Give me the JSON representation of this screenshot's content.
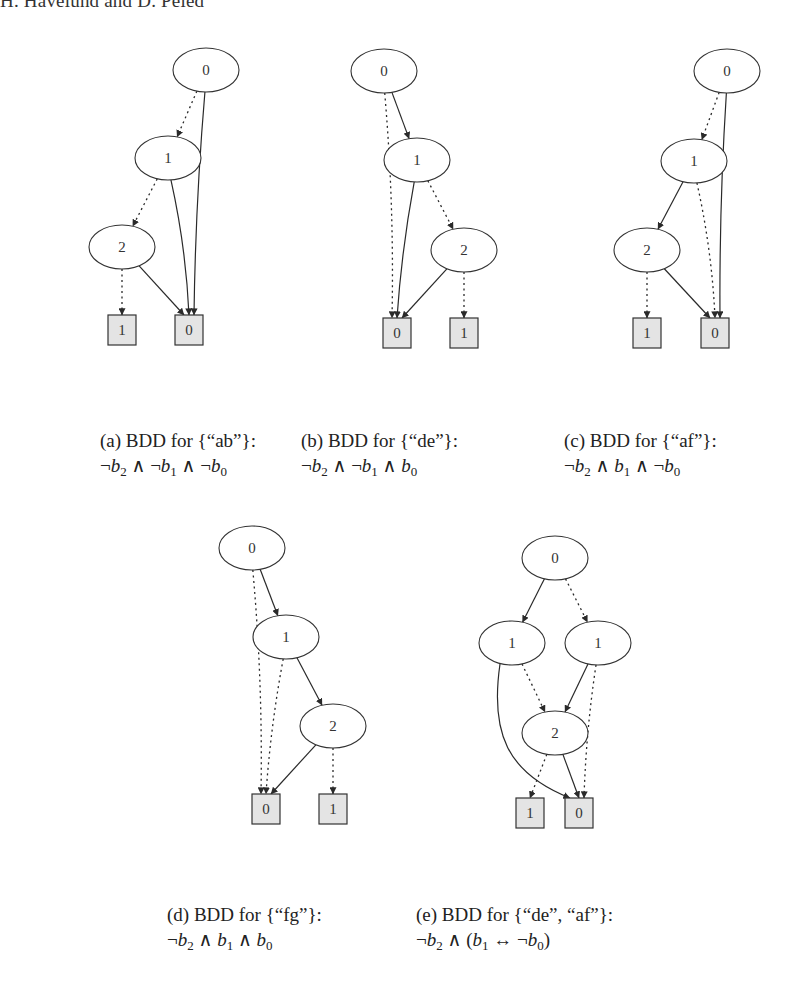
{
  "running_head": "H. Havelund and D. Peled",
  "styles": {
    "node_stroke": "#333333",
    "terminal_fill": "#e4e4e4",
    "text_color": "#222222"
  },
  "legend_semantics": {
    "dotted_edge": "low (false) branch",
    "solid_edge": "high (true) branch"
  },
  "figures": [
    {
      "id": "a",
      "caption_title": "(a) BDD for {“ab”}:",
      "formula_text": "¬b2 ∧ ¬b1 ∧ ¬b0",
      "nodes": [
        {
          "id": "n0",
          "label": "0",
          "type": "var",
          "cx": 206,
          "cy": 70
        },
        {
          "id": "n1",
          "label": "1",
          "type": "var",
          "cx": 168,
          "cy": 158
        },
        {
          "id": "n2",
          "label": "2",
          "type": "var",
          "cx": 122,
          "cy": 247
        },
        {
          "id": "t1",
          "label": "1",
          "type": "terminal",
          "cx": 122,
          "cy": 330
        },
        {
          "id": "t0",
          "label": "0",
          "type": "terminal",
          "cx": 189,
          "cy": 330
        }
      ],
      "edges": [
        {
          "from": "n0",
          "to": "n1",
          "style": "dotted"
        },
        {
          "from": "n0",
          "to": "t0",
          "style": "solid"
        },
        {
          "from": "n1",
          "to": "n2",
          "style": "dotted"
        },
        {
          "from": "n1",
          "to": "t0",
          "style": "solid"
        },
        {
          "from": "n2",
          "to": "t1",
          "style": "dotted"
        },
        {
          "from": "n2",
          "to": "t0",
          "style": "solid"
        }
      ]
    },
    {
      "id": "b",
      "caption_title": "(b) BDD for {“de”}:",
      "formula_text": "¬b2 ∧ ¬b1 ∧ b0",
      "nodes": [
        {
          "id": "n0",
          "label": "0",
          "type": "var",
          "cx": 384,
          "cy": 71
        },
        {
          "id": "n1",
          "label": "1",
          "type": "var",
          "cx": 417,
          "cy": 160
        },
        {
          "id": "n2",
          "label": "2",
          "type": "var",
          "cx": 464,
          "cy": 250
        },
        {
          "id": "t0",
          "label": "0",
          "type": "terminal",
          "cx": 397,
          "cy": 333
        },
        {
          "id": "t1",
          "label": "1",
          "type": "terminal",
          "cx": 464,
          "cy": 333
        }
      ],
      "edges": [
        {
          "from": "n0",
          "to": "t0",
          "style": "dotted"
        },
        {
          "from": "n0",
          "to": "n1",
          "style": "solid"
        },
        {
          "from": "n1",
          "to": "n2",
          "style": "dotted"
        },
        {
          "from": "n1",
          "to": "t0",
          "style": "solid"
        },
        {
          "from": "n2",
          "to": "t1",
          "style": "dotted"
        },
        {
          "from": "n2",
          "to": "t0",
          "style": "solid"
        }
      ]
    },
    {
      "id": "c",
      "caption_title": "(c) BDD for {“af”}:",
      "formula_text": "¬b2 ∧ b1 ∧ ¬b0",
      "nodes": [
        {
          "id": "n0",
          "label": "0",
          "type": "var",
          "cx": 727,
          "cy": 71
        },
        {
          "id": "n1",
          "label": "1",
          "type": "var",
          "cx": 694,
          "cy": 161
        },
        {
          "id": "n2",
          "label": "2",
          "type": "var",
          "cx": 647,
          "cy": 250
        },
        {
          "id": "t1",
          "label": "1",
          "type": "terminal",
          "cx": 647,
          "cy": 333
        },
        {
          "id": "t0",
          "label": "0",
          "type": "terminal",
          "cx": 715,
          "cy": 333
        }
      ],
      "edges": [
        {
          "from": "n0",
          "to": "n1",
          "style": "dotted"
        },
        {
          "from": "n0",
          "to": "t0",
          "style": "solid"
        },
        {
          "from": "n1",
          "to": "n2",
          "style": "solid"
        },
        {
          "from": "n1",
          "to": "t0",
          "style": "dotted"
        },
        {
          "from": "n2",
          "to": "t1",
          "style": "dotted"
        },
        {
          "from": "n2",
          "to": "t0",
          "style": "solid"
        }
      ]
    },
    {
      "id": "d",
      "caption_title": "(d) BDD for {“fg”}:",
      "formula_text": "¬b2 ∧ b1 ∧ b0",
      "nodes": [
        {
          "id": "n0",
          "label": "0",
          "type": "var",
          "cx": 252,
          "cy": 548
        },
        {
          "id": "n1",
          "label": "1",
          "type": "var",
          "cx": 286,
          "cy": 637
        },
        {
          "id": "n2",
          "label": "2",
          "type": "var",
          "cx": 333,
          "cy": 726
        },
        {
          "id": "t0",
          "label": "0",
          "type": "terminal",
          "cx": 266,
          "cy": 809
        },
        {
          "id": "t1",
          "label": "1",
          "type": "terminal",
          "cx": 333,
          "cy": 809
        }
      ],
      "edges": [
        {
          "from": "n0",
          "to": "t0",
          "style": "dotted"
        },
        {
          "from": "n0",
          "to": "n1",
          "style": "solid"
        },
        {
          "from": "n1",
          "to": "t0",
          "style": "dotted"
        },
        {
          "from": "n1",
          "to": "n2",
          "style": "solid"
        },
        {
          "from": "n2",
          "to": "t1",
          "style": "dotted"
        },
        {
          "from": "n2",
          "to": "t0",
          "style": "solid"
        }
      ]
    },
    {
      "id": "e",
      "caption_title": "(e) BDD for {“de”, “af”}:",
      "formula_text": "¬b2 ∧ (b1 ↔ ¬b0)",
      "nodes": [
        {
          "id": "n0",
          "label": "0",
          "type": "var",
          "cx": 555,
          "cy": 558
        },
        {
          "id": "n1a",
          "label": "1",
          "type": "var",
          "cx": 512,
          "cy": 643
        },
        {
          "id": "n1b",
          "label": "1",
          "type": "var",
          "cx": 598,
          "cy": 643
        },
        {
          "id": "n2",
          "label": "2",
          "type": "var",
          "cx": 555,
          "cy": 733
        },
        {
          "id": "t1",
          "label": "1",
          "type": "terminal",
          "cx": 530,
          "cy": 813
        },
        {
          "id": "t0",
          "label": "0",
          "type": "terminal",
          "cx": 579,
          "cy": 813
        }
      ],
      "edges": [
        {
          "from": "n0",
          "to": "n1a",
          "style": "solid"
        },
        {
          "from": "n0",
          "to": "n1b",
          "style": "dotted"
        },
        {
          "from": "n1a",
          "to": "n2",
          "style": "dotted"
        },
        {
          "from": "n1a",
          "to": "t0",
          "style": "solid",
          "curved": true
        },
        {
          "from": "n1b",
          "to": "n2",
          "style": "solid"
        },
        {
          "from": "n1b",
          "to": "t0",
          "style": "dotted"
        },
        {
          "from": "n2",
          "to": "t1",
          "style": "dotted"
        },
        {
          "from": "n2",
          "to": "t0",
          "style": "solid"
        }
      ]
    }
  ]
}
